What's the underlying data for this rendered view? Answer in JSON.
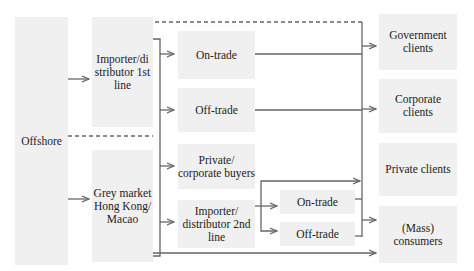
{
  "diagram": {
    "nodes": {
      "offshore": "Offshore",
      "importer1": "Importer/di stributor 1st line",
      "grey": "Grey market Hong Kong/ Macao",
      "ontrade1": "On-trade",
      "offtrade1": "Off-trade",
      "private_buyers": "Private/ corporate buyers",
      "importer2": "Importer/ distributor 2nd line",
      "ontrade2": "On-trade",
      "offtrade2": "Off-trade",
      "gov": "Government clients",
      "corp": "Corporate clients",
      "private_clients": "Private clients",
      "mass": "(Mass) consumers"
    },
    "colors": {
      "box_fill": "#f0f0f0",
      "line": "#666666",
      "text": "#222222"
    }
  }
}
